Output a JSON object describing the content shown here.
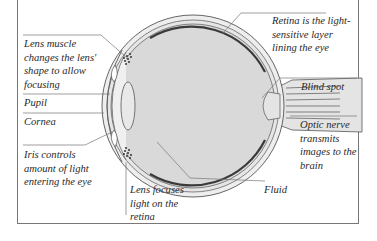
{
  "diagram": {
    "colors": {
      "frame": "#777777",
      "eyeball_fill": "#d9d9d9",
      "outline": "#555555",
      "retina_band": "#3a3a3a",
      "leader_line": "#777777",
      "text": "#2a2a2a"
    },
    "labels": {
      "lens_muscle": "Lens muscle changes the lens' shape to allow focusing",
      "pupil": "Pupil",
      "cornea": "Cornea",
      "iris": "Iris controls amount of light entering the eye",
      "lens_focuses": "Lens focuses light on the retina",
      "retina": "Retina is the light-sensitive layer lining the eye",
      "blind_spot": "Blind spot",
      "optic_nerve": "Optic nerve transmits images to the brain",
      "fluid": "Fluid"
    },
    "label_lines": {
      "lens_muscle": [
        "Lens muscle",
        "changes the lens'",
        "shape to allow",
        "focusing"
      ],
      "iris": [
        "Iris controls",
        "amount of light",
        "entering the eye"
      ],
      "lens_focuses": [
        "Lens focuses",
        "light on the",
        "retina"
      ],
      "retina": [
        "Retina is the light-",
        "sensitive layer",
        "lining the eye"
      ],
      "optic_nerve": [
        "Optic nerve",
        "transmits",
        "images to the",
        "brain"
      ]
    }
  }
}
